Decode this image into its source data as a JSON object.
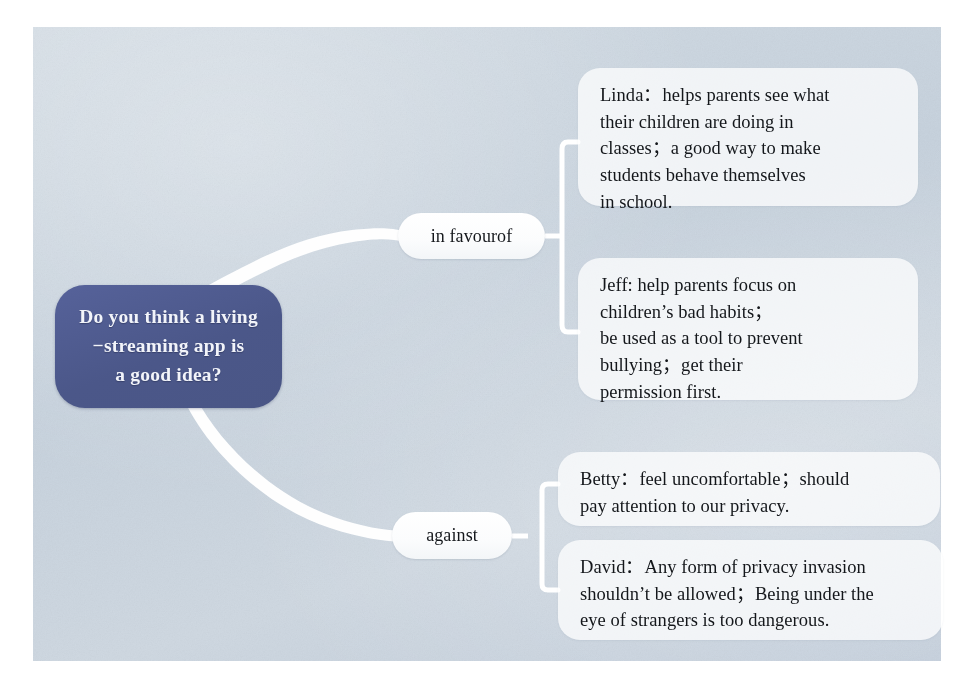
{
  "diagram": {
    "type": "mind-map",
    "title_question": "Do you think a living\n−streaming app is\na good idea?",
    "root": {
      "label": "Do you think a living −streaming app is a good idea?",
      "line1": "Do you think a living",
      "line2": "−streaming app is",
      "line3": "a good idea?",
      "color": "#4f5c91",
      "text_color": "#f2f4fa"
    },
    "branches": [
      {
        "id": "in-favour-of",
        "label": "in favourof",
        "notes": [
          {
            "id": "linda",
            "speaker": "Linda",
            "text": "Linda：helps parents see what their children are doing in classes；a good way to make students behave themselves in school.",
            "lines": [
              "Linda：helps parents see what",
              "their children are doing in",
              "classes；a good way to make",
              "students behave themselves",
              "in school."
            ]
          },
          {
            "id": "jeff",
            "speaker": "Jeff",
            "text": "Jeff: help parents focus on children's bad habits； be used as a tool to prevent bullying； get their permission first.",
            "lines": [
              "Jeff: help parents focus on",
              "children’s bad habits；",
              "be used as a tool to prevent",
              "bullying；get their",
              "permission first."
            ]
          }
        ]
      },
      {
        "id": "against",
        "label": "against",
        "notes": [
          {
            "id": "betty",
            "speaker": "Betty",
            "text": "Betty：feel uncomfortable；should pay attention to our privacy.",
            "lines": [
              "Betty：feel uncomfortable；should",
              "pay attention to our privacy."
            ]
          },
          {
            "id": "david",
            "speaker": "David",
            "text": "David：Any form of privacy invasion shouldn't be allowed；Being under the eye of strangers is too dangerous.",
            "lines": [
              "David：Any form of privacy invasion",
              "shouldn’t be allowed；Being under the",
              "eye of strangers is too dangerous."
            ]
          }
        ]
      }
    ],
    "palette": {
      "page_background": "#ffffff",
      "panel_background": "#ccd6e0",
      "root_fill": "#4f5c91",
      "connector": "#ffffff",
      "pill_fill": "#fdfdfd",
      "note_fill": "rgba(255,255,255,0.74)",
      "body_text": "#14171b"
    }
  }
}
